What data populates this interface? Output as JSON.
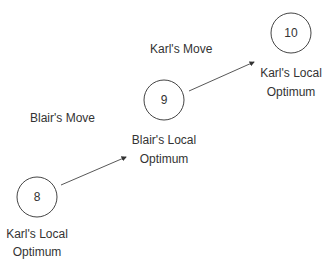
{
  "nodes": [
    {
      "id": "node-8",
      "value": "8",
      "label_line1": "Karl's Local",
      "label_line2": "Optimum"
    },
    {
      "id": "node-9",
      "value": "9",
      "label_line1": "Blair's Local",
      "label_line2": "Optimum"
    },
    {
      "id": "node-10",
      "value": "10",
      "label_line1": "Karl's Local",
      "label_line2": "Optimum"
    }
  ],
  "edges": [
    {
      "from": "8",
      "to": "9",
      "label": "Blair's Move"
    },
    {
      "from": "9",
      "to": "10",
      "label": "Karl's Move"
    }
  ],
  "colors": {
    "stroke": "#333333",
    "text": "#333333",
    "background": "#ffffff"
  }
}
